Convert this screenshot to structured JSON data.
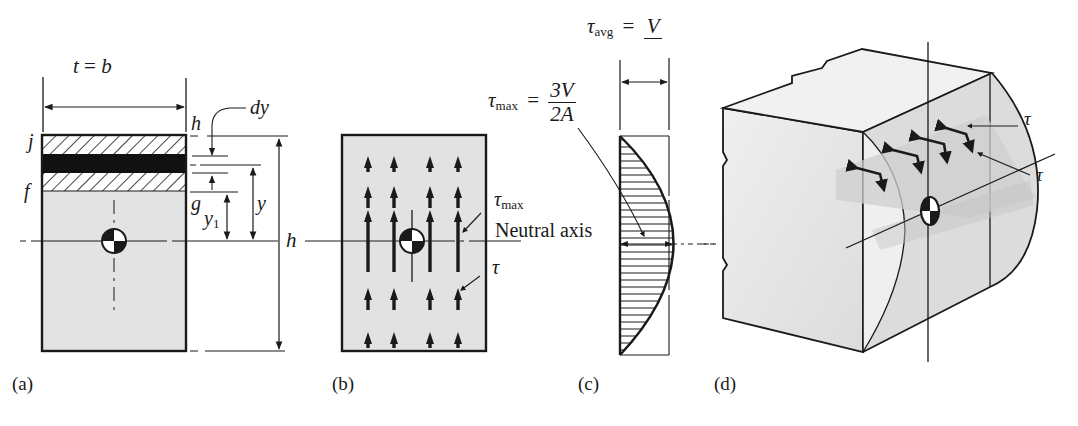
{
  "figure": {
    "panels": [
      {
        "id": "a",
        "caption": "(a)"
      },
      {
        "id": "b",
        "caption": "(b)"
      },
      {
        "id": "c",
        "caption": "(c)"
      },
      {
        "id": "d",
        "caption": "(d)"
      }
    ],
    "panel_a": {
      "width_label_lhs": "t",
      "width_label_eq": "=",
      "width_label_rhs": "b",
      "label_j": "j",
      "label_f": "f",
      "label_g": "g",
      "label_h_top": "h",
      "label_dy": "dy",
      "label_y": "y",
      "label_y1_base": "y",
      "label_y1_sub": "1",
      "label_h_height": "h"
    },
    "panel_b": {
      "tau_max_sym": "τ",
      "tau_max_sub": "max",
      "tau_sym": "τ",
      "arrow_columns": 4,
      "arrow_rows": 6
    },
    "panel_c": {
      "tau_avg_sym": "τ",
      "tau_avg_sub": "avg",
      "tau_avg_eq": "=",
      "tau_avg_num": "V",
      "tau_max_sym": "τ",
      "tau_max_sub": "max",
      "tau_max_eq": "=",
      "tau_max_num": "3V",
      "tau_max_den": "2A",
      "neutral_axis_label": "Neutral axis"
    },
    "panel_d": {
      "tau_top": "τ",
      "tau_bottom": "τ"
    },
    "colors": {
      "ink": "#1a1a1a",
      "fill_light": "#e4e4e4",
      "fill_mid": "#d2d2d2",
      "fill_dark": "#bdbdbd",
      "paper": "#ffffff"
    }
  }
}
